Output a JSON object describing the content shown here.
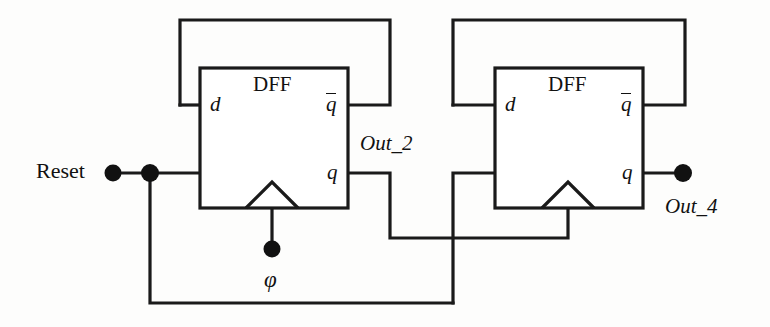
{
  "diagram": {
    "type": "circuit-schematic",
    "line_color": "#1a1a1a",
    "background_color": "#fdfdfc"
  },
  "blocks": [
    {
      "id": "dff1",
      "label": "DFF",
      "pins": {
        "d": "d",
        "qbar": "q",
        "q": "q",
        "clock": "clock-triangle"
      },
      "rect": {
        "x": 200,
        "y": 68,
        "w": 148,
        "h": 140
      }
    },
    {
      "id": "dff2",
      "label": "DFF",
      "pins": {
        "d": "d",
        "qbar": "q",
        "q": "q",
        "clock": "clock-triangle"
      },
      "rect": {
        "x": 495,
        "y": 68,
        "w": 148,
        "h": 140
      }
    }
  ],
  "signals": {
    "reset": "Reset",
    "out_2": "Out_2",
    "out_4": "Out_4",
    "clock": "φ"
  },
  "terminals": [
    {
      "name": "reset-terminal",
      "x": 113,
      "y": 173
    },
    {
      "name": "reset-junction",
      "x": 150,
      "y": 173
    },
    {
      "name": "clock-terminal",
      "x": 272,
      "y": 249
    },
    {
      "name": "out4-terminal",
      "x": 683,
      "y": 173
    }
  ],
  "nets": [
    {
      "name": "dff1-qbar-to-d-feedback",
      "path": "M 180 105 L 180 20 L 390 20 L 390 105 L 348 105 M 180 105 L 200 105"
    },
    {
      "name": "dff2-qbar-to-d-feedback",
      "path": "M 453 105 L 453 20 L 685 20 L 685 105 L 643 105 M 453 105 L 495 105"
    },
    {
      "name": "reset-net",
      "path": "M 113 173 L 200 173"
    },
    {
      "name": "reset-down-to-bottom",
      "path": "M 150 173 L 150 303 L 453 303"
    },
    {
      "name": "out2-net",
      "path": "M 348 173 L 390 173 L 390 238 L 568 238 L 568 208"
    },
    {
      "name": "clock-net-dff1",
      "path": "M 272 208 L 272 249"
    },
    {
      "name": "clock-riser-dff2",
      "path": "M 453 303 L 453 173 L 495 173"
    },
    {
      "name": "out4-net",
      "path": "M 643 173 L 683 173"
    }
  ],
  "labels": {
    "dff1_name": "DFF",
    "dff2_name": "DFF",
    "dff1_d": "d",
    "dff1_qbar": "q",
    "dff1_q": "q",
    "dff2_d": "d",
    "dff2_qbar": "q",
    "dff2_q": "q"
  }
}
